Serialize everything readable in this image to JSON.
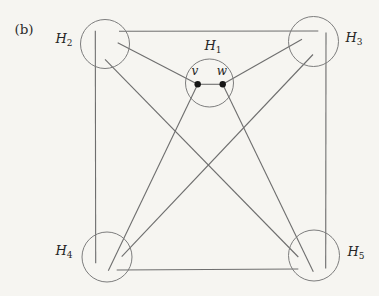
{
  "figure": {
    "panel_label": "(b)",
    "panel_label_pos": {
      "x": 24,
      "y": 29
    },
    "colors": {
      "background": "#f6f5f1",
      "edge_line": "#6e6e6e",
      "circle_stroke": "#7d7d7d",
      "vertex_dot": "#161616",
      "text": "#262626"
    },
    "clusters": [
      {
        "id": "H1",
        "label": "H",
        "sub": "1",
        "cx": 209.5,
        "cy": 83,
        "r": 24,
        "label_x": 213,
        "label_y": 47
      },
      {
        "id": "H2",
        "label": "H",
        "sub": "2",
        "cx": 105,
        "cy": 44,
        "r": 24.5,
        "label_x": 64,
        "label_y": 40
      },
      {
        "id": "H3",
        "label": "H",
        "sub": "3",
        "cx": 313.5,
        "cy": 41.5,
        "r": 25,
        "label_x": 354,
        "label_y": 39
      },
      {
        "id": "H4",
        "label": "H",
        "sub": "4",
        "cx": 107,
        "cy": 257,
        "r": 25,
        "label_x": 64,
        "label_y": 252
      },
      {
        "id": "H5",
        "label": "H",
        "sub": "5",
        "cx": 314,
        "cy": 255.5,
        "r": 25.5,
        "label_x": 356,
        "label_y": 253
      }
    ],
    "vertices": [
      {
        "id": "v",
        "label": "v",
        "x": 197.7,
        "y": 84.3,
        "r": 3.2,
        "label_x": 195,
        "label_y": 71
      },
      {
        "id": "w",
        "label": "w",
        "x": 222.7,
        "y": 84.3,
        "r": 3.2,
        "label_x": 222,
        "label_y": 71
      }
    ],
    "edges": [
      {
        "from": "H2",
        "to": "H3",
        "x1": 119,
        "y1": 31.3,
        "x2": 318.3,
        "y2": 31
      },
      {
        "from": "H2",
        "to": "H4",
        "x1": 95.3,
        "y1": 30.7,
        "x2": 95.7,
        "y2": 263.3
      },
      {
        "from": "H3",
        "to": "H5",
        "x1": 326,
        "y1": 32.5,
        "x2": 325.7,
        "y2": 268.5
      },
      {
        "from": "H4",
        "to": "H5",
        "x1": 116.7,
        "y1": 270,
        "x2": 298.3,
        "y2": 269
      },
      {
        "from": "H2",
        "to": "H5",
        "x1": 105,
        "y1": 59.3,
        "x2": 298.3,
        "y2": 257
      },
      {
        "from": "H3",
        "to": "H4",
        "x1": 313,
        "y1": 54.5,
        "x2": 121.7,
        "y2": 256.7
      },
      {
        "from": "H2",
        "to": "v",
        "x1": 117.7,
        "y1": 42.7,
        "x2": 197.7,
        "y2": 84.3
      },
      {
        "from": "w",
        "to": "H3",
        "x1": 222.7,
        "y1": 84.3,
        "x2": 302,
        "y2": 39.3
      },
      {
        "from": "v",
        "to": "H4",
        "x1": 197.7,
        "y1": 84.3,
        "x2": 108.3,
        "y2": 270.7
      },
      {
        "from": "w",
        "to": "H5",
        "x1": 222.7,
        "y1": 84.3,
        "x2": 313.3,
        "y2": 271.7
      },
      {
        "from": "v",
        "to": "w",
        "x1": 197.7,
        "y1": 84.3,
        "x2": 222.7,
        "y2": 84.3
      }
    ]
  }
}
